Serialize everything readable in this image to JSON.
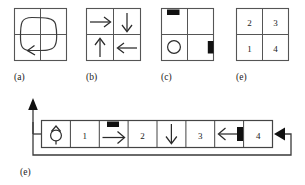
{
  "figure": {
    "background_color": "#ffffff",
    "line_color": "#3a3a3a",
    "block_color": "#111111",
    "panels": [
      {
        "id": "a",
        "caption": "(a)",
        "kind": "grid-2x2-loop",
        "description": "2 by 2 grid with a closed rounded rectangular loop path carrying a left-pointing arrowhead at the lower left",
        "cells": [
          "",
          "",
          "",
          ""
        ]
      },
      {
        "id": "b",
        "caption": "(b)",
        "kind": "grid-2x2-arrows",
        "description": "2 by 2 grid, one directional arrow drawn inside each cell",
        "cells": [
          {
            "position": "top-left",
            "glyph": "arrow-right-icon",
            "direction": "right"
          },
          {
            "position": "top-right",
            "glyph": "arrow-down-icon",
            "direction": "down"
          },
          {
            "position": "bottom-left",
            "glyph": "arrow-up-icon",
            "direction": "up"
          },
          {
            "position": "bottom-right",
            "glyph": "arrow-left-icon",
            "direction": "left"
          }
        ]
      },
      {
        "id": "c",
        "caption": "(c)",
        "kind": "grid-2x2-markers",
        "description": "2 by 2 grid with a horizontal black bar at the top of the top-left cell, an open circle in the bottom-left cell, and a vertical black bar on the right edge of the bottom-right cell",
        "cells": [
          {
            "position": "top-left",
            "glyph": "black-bar-horizontal-icon"
          },
          {
            "position": "top-right",
            "glyph": ""
          },
          {
            "position": "bottom-left",
            "glyph": "circle-icon"
          },
          {
            "position": "bottom-right",
            "glyph": "black-bar-vertical-icon"
          }
        ]
      },
      {
        "id": "d",
        "caption": "(d)",
        "kind": "grid-2x2-numbers",
        "description": "2 by 2 grid of numbered cells",
        "cells": [
          {
            "position": "top-left",
            "label": "2"
          },
          {
            "position": "top-right",
            "label": "3"
          },
          {
            "position": "bottom-left",
            "label": "1"
          },
          {
            "position": "bottom-right",
            "label": "4"
          }
        ]
      },
      {
        "id": "e",
        "caption": "(e)",
        "kind": "linear-strip-with-feedback-loop",
        "description": "Horizontal strip of eight cells, an output arrow rising from the left end and a feedback wire returning from the right end, entering through a solid left-pointing arrowhead",
        "cells": [
          {
            "index": 1,
            "glyph": "robot-heading-icon",
            "label": ""
          },
          {
            "index": 2,
            "glyph": "",
            "label": "1"
          },
          {
            "index": 3,
            "glyph": "arrow-right-icon",
            "label": "",
            "marker": "black-bar-horizontal-icon"
          },
          {
            "index": 4,
            "glyph": "",
            "label": "2"
          },
          {
            "index": 5,
            "glyph": "arrow-down-icon",
            "label": ""
          },
          {
            "index": 6,
            "glyph": "",
            "label": "3"
          },
          {
            "index": 7,
            "glyph": "arrow-left-icon",
            "label": "",
            "marker": "black-bar-vertical-icon"
          },
          {
            "index": 8,
            "glyph": "",
            "label": "4"
          }
        ],
        "connectors": [
          {
            "name": "output-arrow-up",
            "glyph": "arrow-up-solid-icon"
          },
          {
            "name": "feedback-wire",
            "glyph": "feedback-loop-icon"
          },
          {
            "name": "input-arrow-left",
            "glyph": "arrow-left-solid-icon"
          }
        ]
      }
    ]
  }
}
